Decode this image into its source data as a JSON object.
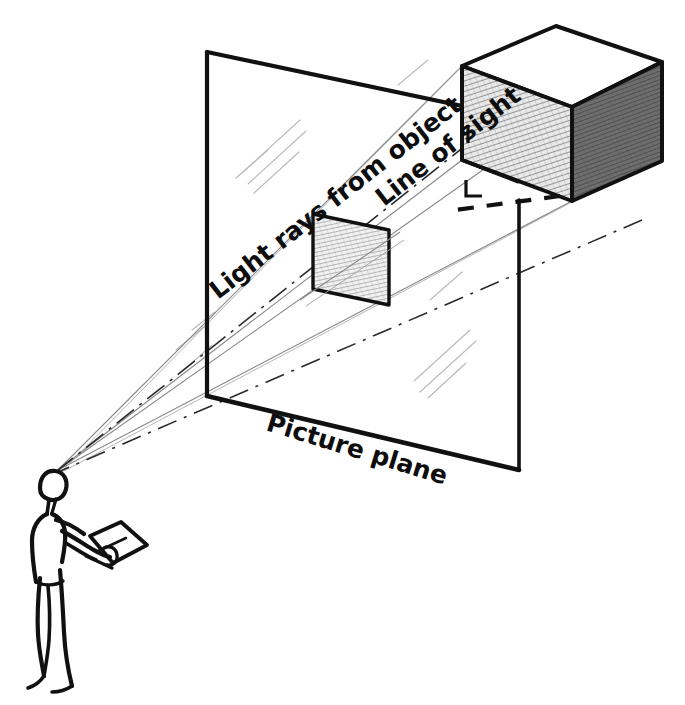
{
  "diagram": {
    "type": "technical-illustration",
    "style": "hand-drawn pencil and ink sketch",
    "background_color": "#ffffff",
    "ink_color": "#111111",
    "pencil_color": "#9a9a9a",
    "labels": {
      "light_rays": "Light rays from object",
      "line_of_sight": "Line of sight",
      "picture_plane": "Picture plane"
    },
    "label_rotations": {
      "light_rays": -38,
      "line_of_sight": -38,
      "picture_plane": 17
    },
    "elements": {
      "picture_plane": {
        "name": "picture plane",
        "shape": "parallelogram",
        "corners": [
          [
            207,
            52
          ],
          [
            519,
            118
          ],
          [
            519,
            470
          ],
          [
            207,
            396
          ]
        ],
        "fill": "none",
        "stroke": "#111111"
      },
      "projected_image": {
        "name": "projected image of cube on picture plane",
        "shape": "parallelogram",
        "corners": [
          [
            313,
            214
          ],
          [
            389,
            230
          ],
          [
            389,
            305
          ],
          [
            313,
            289
          ]
        ],
        "fill": "hatched-light",
        "stroke": "#111111"
      },
      "cube": {
        "name": "object cube",
        "top_face": [
          [
            462,
            66
          ],
          [
            556,
            26
          ],
          [
            662,
            62
          ],
          [
            572,
            107
          ]
        ],
        "left_face": [
          [
            462,
            66
          ],
          [
            572,
            107
          ],
          [
            572,
            201
          ],
          [
            462,
            160
          ]
        ],
        "right_face": [
          [
            572,
            107
          ],
          [
            662,
            62
          ],
          [
            662,
            161
          ],
          [
            572,
            201
          ]
        ],
        "top_fill": "#ffffff",
        "left_fill": "hatched-medium",
        "right_fill": "#777777"
      },
      "observer": {
        "name": "standing observer holding a sketchpad",
        "eye_point": [
          58,
          470
        ],
        "head_center": [
          50,
          487
        ],
        "head_radius": 14
      }
    },
    "rays": {
      "light_rays_count": 4,
      "description": "straight construction lines converging from cube corners through the projected image to the observer's eye",
      "eye_point": [
        58,
        470
      ]
    },
    "line_of_sight": {
      "style": "dashed",
      "from": [
        58,
        470
      ],
      "to": [
        572,
        201
      ],
      "perpendicular_tick": true
    }
  }
}
